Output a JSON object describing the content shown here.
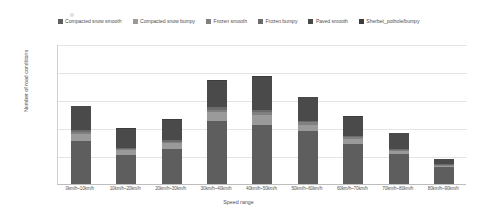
{
  "chart_data": {
    "type": "bar",
    "stacked": true,
    "title": "",
    "xlabel": "Speed range",
    "ylabel": "Number of road conditions",
    "ylim": [
      0,
      2500
    ],
    "yticks": [
      0,
      500,
      1000,
      1500,
      2000,
      2500
    ],
    "ytick_labels": [
      "0",
      "500",
      "1000",
      "1500",
      "2000",
      "2500"
    ],
    "grid": true,
    "legend_position": "top",
    "categories": [
      "0km/h~10km/h",
      "10km/h~20km/h",
      "20km/h~30km/h",
      "30km/h~40km/h",
      "40km/h~50km/h",
      "50km/h~60km/h",
      "60km/h~70km/h",
      "70km/h~80km/h",
      "80km/h~90km/h"
    ],
    "series": [
      {
        "name": "Compacted snow smooth",
        "color": "#5e5e5e",
        "values": [
          760,
          520,
          620,
          1130,
          1060,
          940,
          720,
          530,
          300
        ]
      },
      {
        "name": "Compacted snow bumpy",
        "color": "#9a9a9a",
        "values": [
          130,
          85,
          105,
          150,
          170,
          120,
          90,
          55,
          30
        ]
      },
      {
        "name": "Frozen smooth",
        "color": "#808080",
        "values": [
          40,
          25,
          30,
          50,
          55,
          40,
          30,
          20,
          10
        ]
      },
      {
        "name": "Frozen bumpy",
        "color": "#6b6b6b",
        "values": [
          30,
          20,
          25,
          40,
          45,
          30,
          25,
          15,
          10
        ]
      },
      {
        "name": "Paved smooth",
        "color": "#4a4a4a",
        "values": [
          430,
          340,
          370,
          470,
          590,
          420,
          340,
          290,
          100
        ]
      },
      {
        "name": "Sherbet_pothole/bumpy",
        "color": "#3c3c3c",
        "values": [
          10,
          10,
          10,
          10,
          10,
          10,
          10,
          10,
          0
        ]
      }
    ],
    "totals": [
      1400,
      1000,
      1160,
      1850,
      1930,
      1560,
      1215,
      920,
      450
    ]
  },
  "axes": {
    "y_title": "Number of road conditions",
    "x_title": "Speed range",
    "y_ticks": [
      "2500",
      "2000",
      "1500",
      "1000",
      "500",
      "0"
    ]
  },
  "legend": {
    "items": [
      {
        "label": "Compacted snow smooth",
        "color": "#5e5e5e"
      },
      {
        "label": "Compacted snow bumpy",
        "color": "#9a9a9a"
      },
      {
        "label": "Frozen smooth",
        "color": "#808080"
      },
      {
        "label": "Frozen bumpy",
        "color": "#6b6b6b"
      },
      {
        "label": "Paved smooth",
        "color": "#4a4a4a"
      },
      {
        "label": "Sherbet_pothole/bumpy",
        "color": "#3c3c3c"
      }
    ]
  }
}
